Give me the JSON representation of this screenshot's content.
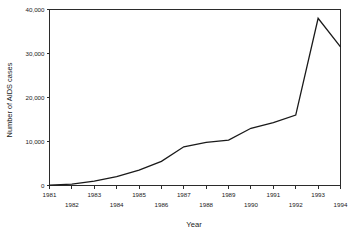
{
  "chart_data": {
    "type": "line",
    "title": "",
    "subtitle": "",
    "xlabel": "Year",
    "ylabel": "Number of AIDS cases",
    "x": [
      1981,
      1982,
      1983,
      1984,
      1985,
      1986,
      1987,
      1988,
      1989,
      1990,
      1991,
      1992,
      1993,
      1994
    ],
    "values": [
      100,
      300,
      1000,
      2000,
      3500,
      5500,
      8800,
      9800,
      10300,
      13000,
      14300,
      16000,
      38000,
      31500
    ],
    "series": [
      {
        "name": "AIDS cases",
        "values": [
          100,
          300,
          1000,
          2000,
          3500,
          5500,
          8800,
          9800,
          10300,
          13000,
          14300,
          16000,
          38000,
          31500
        ]
      }
    ],
    "xlim": [
      1981,
      1994
    ],
    "ylim": [
      0,
      40000
    ],
    "xticks": [
      1981,
      1982,
      1983,
      1984,
      1985,
      1986,
      1987,
      1988,
      1989,
      1990,
      1991,
      1992,
      1993,
      1994
    ],
    "xtick_labels": [
      "1981",
      "1982",
      "1983",
      "1984",
      "1985",
      "1986",
      "1987",
      "1988",
      "1989",
      "1990",
      "1991",
      "1992",
      "1993",
      "1994"
    ],
    "yticks": [
      0,
      10000,
      20000,
      30000,
      40000
    ],
    "ytick_labels": [
      "0",
      "10,000",
      "20,000",
      "30,000",
      "40,000"
    ],
    "grid": false,
    "legend": false,
    "legend_position": "none",
    "line_color": "#1a1a1a",
    "axis_color": "#2b2b2b",
    "background_color": "#ffffff",
    "xtick_label_stagger": true,
    "annotations": []
  },
  "axis": {
    "ylabel": "Number of AIDS cases",
    "xlabel": "Year"
  }
}
